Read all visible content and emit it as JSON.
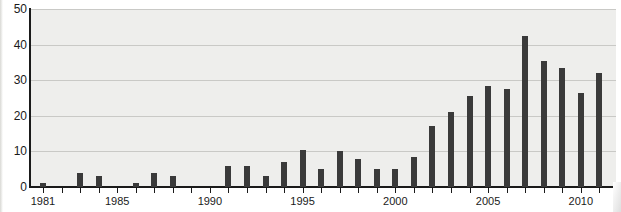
{
  "chart_data": {
    "type": "bar",
    "title": "",
    "subtitle": "",
    "xlabel": "",
    "ylabel": "",
    "xlim": [
      1980.3,
      2011.9
    ],
    "ylim": [
      0,
      50
    ],
    "yticks": [
      0,
      10,
      20,
      30,
      40,
      50
    ],
    "ytick_labels": [
      "0",
      "10",
      "20",
      "30",
      "40",
      "50"
    ],
    "xticks": [
      1981,
      1985,
      1990,
      1995,
      2000,
      2005,
      2010
    ],
    "xtick_labels": [
      "1981",
      "1985",
      "1990",
      "1995",
      "2000",
      "2005",
      "2010"
    ],
    "grid": "horizontal",
    "legend": null,
    "bar_color": "#3a3a3a",
    "plot_background": "#eeeeec",
    "gridline_color": "#c9c9c6",
    "axis_color": "#1a1a1a",
    "categories": [
      "1981",
      "1982",
      "1983",
      "1984",
      "1985",
      "1986",
      "1987",
      "1988",
      "1989",
      "1990",
      "1991",
      "1992",
      "1993",
      "1994",
      "1995",
      "1996",
      "1997",
      "1998",
      "1999",
      "2000",
      "2001",
      "2002",
      "2003",
      "2004",
      "2005",
      "2006",
      "2007",
      "2008",
      "2009",
      "2010",
      "2011"
    ],
    "values": [
      1,
      0,
      4,
      3,
      0,
      1,
      4,
      3,
      0,
      0,
      6,
      6,
      3,
      7,
      10.5,
      5,
      10,
      8,
      5,
      5,
      8.5,
      17,
      21,
      25.5,
      28.5,
      27.5,
      42.5,
      35.5,
      33.5,
      26.5,
      32
    ]
  }
}
